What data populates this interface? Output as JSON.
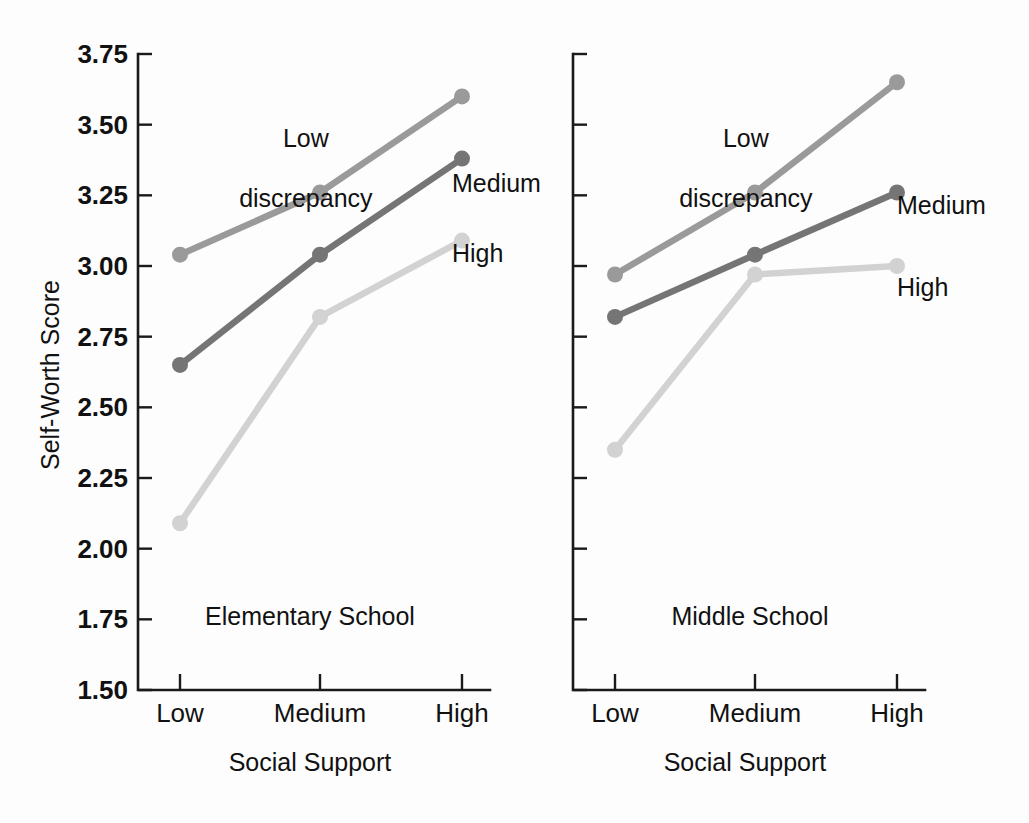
{
  "figure": {
    "background_color": "#fdfdfd",
    "text_color": "#111111"
  },
  "axis": {
    "y_title": "Self-Worth Score",
    "x_title": "Social Support",
    "y_ticks": [
      "3.75",
      "3.50",
      "3.25",
      "3.00",
      "2.75",
      "2.50",
      "2.25",
      "2.00",
      "1.75",
      "1.50"
    ],
    "x_ticks": [
      "Low",
      "Medium",
      "High"
    ]
  },
  "series_labels": {
    "low": "Low\ndiscrepancy",
    "low_line1": "Low",
    "low_line2": "discrepancy",
    "medium": "Medium",
    "high": "High"
  },
  "series_colors": {
    "low_discrepancy": "#9a9a9a",
    "medium": "#757575",
    "high": "#d2d2d2"
  },
  "panels": [
    {
      "caption": "Elementary School",
      "x_title": "Social Support"
    },
    {
      "caption": "Middle School",
      "x_title": "Social Support"
    }
  ],
  "chart_data": {
    "type": "line",
    "title": "",
    "xlabel": "Social Support",
    "ylabel": "Self-Worth Score",
    "ylim": [
      1.5,
      3.75
    ],
    "ytick_step": 0.25,
    "grid": false,
    "legend": "inline annotations at line ends",
    "categories": [
      "Low",
      "Medium",
      "High"
    ],
    "panels": [
      {
        "name": "Elementary School",
        "series": [
          {
            "name": "Low discrepancy",
            "color": "#9a9a9a",
            "values": [
              3.04,
              3.26,
              3.6
            ]
          },
          {
            "name": "Medium",
            "color": "#757575",
            "values": [
              2.65,
              3.04,
              3.38
            ]
          },
          {
            "name": "High",
            "color": "#d2d2d2",
            "values": [
              2.09,
              2.82,
              3.09
            ]
          }
        ]
      },
      {
        "name": "Middle School",
        "series": [
          {
            "name": "Low discrepancy",
            "color": "#9a9a9a",
            "values": [
              2.97,
              3.26,
              3.65
            ]
          },
          {
            "name": "Medium",
            "color": "#757575",
            "values": [
              2.82,
              3.04,
              3.26
            ]
          },
          {
            "name": "High",
            "color": "#d2d2d2",
            "values": [
              2.35,
              2.97,
              3.0
            ]
          }
        ]
      }
    ]
  }
}
